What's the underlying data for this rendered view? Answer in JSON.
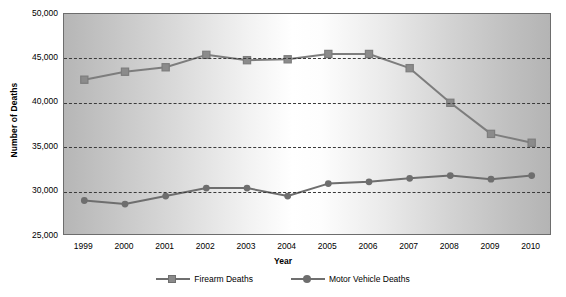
{
  "chart_data": {
    "type": "line",
    "title": "",
    "xlabel": "Year",
    "ylabel": "Number of Deaths",
    "categories": [
      "1999",
      "2000",
      "2001",
      "2002",
      "2003",
      "2004",
      "2005",
      "2006",
      "2007",
      "2008",
      "2009",
      "2010"
    ],
    "x": [
      1999,
      2000,
      2001,
      2002,
      2003,
      2004,
      2005,
      2006,
      2007,
      2008,
      2009,
      2010
    ],
    "ylim": [
      25000,
      50000
    ],
    "ytick_labels": [
      "50,000",
      "45,000",
      "40,000",
      "35,000",
      "30,000",
      "25,000"
    ],
    "ytick_values": [
      50000,
      45000,
      40000,
      35000,
      30000,
      25000
    ],
    "grid": "horizontal-dashed",
    "legend_position": "bottom-center",
    "series": [
      {
        "name": "Firearm Deaths",
        "marker": "square",
        "color": "#7d7d7d",
        "values": [
          42600,
          43500,
          44000,
          45400,
          44800,
          44900,
          45500,
          45500,
          43900,
          40000,
          36500,
          35500
        ]
      },
      {
        "name": "Motor Vehicle Deaths",
        "marker": "circle",
        "color": "#6e6e6e",
        "values": [
          29000,
          28600,
          29500,
          30400,
          30400,
          29500,
          30900,
          31100,
          31500,
          31800,
          31400,
          31800
        ]
      }
    ]
  },
  "axes": {
    "y_title": "Number of Deaths",
    "x_title": "Year"
  },
  "legend": {
    "items": [
      {
        "label": "Firearm Deaths",
        "marker": "square-marker-icon"
      },
      {
        "label": "Motor Vehicle Deaths",
        "marker": "circle-marker-icon"
      }
    ]
  },
  "colors": {
    "series_firearm": "#7d7d7d",
    "series_motor_vehicle": "#6e6e6e",
    "gridline": "#3a3a3a",
    "frame": "#6d6d6d",
    "text": "#000000"
  }
}
